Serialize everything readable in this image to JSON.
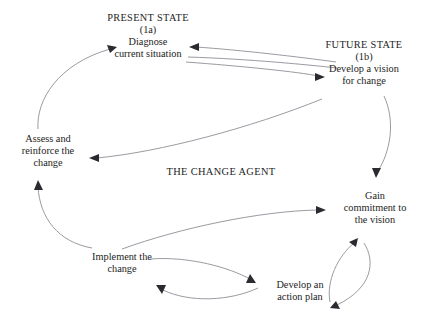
{
  "diagram": {
    "center_label": "THE CHANGE AGENT",
    "nodes": [
      {
        "id": "present_state",
        "heading": "PRESENT STATE",
        "marker": "(1a)",
        "lines": [
          "Diagnose",
          "current situation"
        ]
      },
      {
        "id": "future_state",
        "heading": "FUTURE STATE",
        "marker": "(1b)",
        "lines": [
          "Develop a vision",
          "for change"
        ]
      },
      {
        "id": "assess",
        "lines": [
          "Assess and",
          "reinforce the",
          "change"
        ]
      },
      {
        "id": "gain_commitment",
        "lines": [
          "Gain",
          "commitment to",
          "the vision"
        ]
      },
      {
        "id": "implement",
        "lines": [
          "Implement the",
          "change"
        ]
      },
      {
        "id": "action_plan",
        "lines": [
          "Develop an",
          "action plan"
        ]
      }
    ],
    "colors": {
      "line": "#8e8e96",
      "arrow": "#2a2a31",
      "text": "#1d1d22",
      "background": "#ffffff"
    }
  }
}
